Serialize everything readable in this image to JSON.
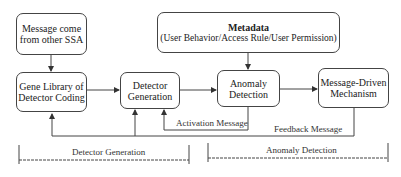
{
  "nodes": {
    "message_source": {
      "line1": "Message come",
      "line2": "from other SSA"
    },
    "gene_library": {
      "line1": "Gene Library of",
      "line2": "Detector Coding"
    },
    "detector_generation": {
      "line1": "Detector",
      "line2": "Generation"
    },
    "metadata": {
      "title": "Metadata",
      "subtitle": "(User Behavior/Access Rule/User Permission)"
    },
    "anomaly_detection": {
      "line1": "Anomaly",
      "line2": "Detection"
    },
    "message_driven": {
      "line1": "Message-Driven",
      "line2": "Mechanism"
    }
  },
  "edges": {
    "activation_label": "Activation Message",
    "feedback_label": "Feedback Message"
  },
  "phases": {
    "left": "Detector Generation",
    "right": "Anomaly Detection"
  },
  "colors": {
    "line": "#444444",
    "background": "#ffffff"
  }
}
